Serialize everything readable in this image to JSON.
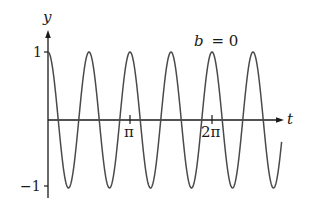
{
  "chart_data": {
    "type": "line",
    "title": "",
    "annotation": "b = 0",
    "annotation_var": "b",
    "annotation_eq": "= 0",
    "xlabel": "t",
    "ylabel": "y",
    "x_ticks": [
      {
        "value": 3.14159,
        "label": "π"
      },
      {
        "value": 6.28318,
        "label": "2π"
      }
    ],
    "y_ticks": [
      {
        "value": 1,
        "label": "1"
      },
      {
        "value": -1,
        "label": "−1"
      }
    ],
    "xlim": [
      0,
      9.0
    ],
    "ylim": [
      -1,
      1
    ],
    "grid": false,
    "legend": null,
    "series": [
      {
        "name": "y = cos(4t)",
        "function": "cos",
        "amplitude": 1,
        "angular_frequency": 4,
        "damping": 0,
        "t_start": 0,
        "t_end": 8.95,
        "color": "#4a4a4a"
      }
    ]
  },
  "labels": {
    "y_axis": "y",
    "x_axis": "t",
    "tick_pi": "π",
    "tick_2pi": "2π",
    "y_one": "1",
    "y_neg_one": "−1",
    "b_var": "b",
    "b_eq": "= 0"
  }
}
